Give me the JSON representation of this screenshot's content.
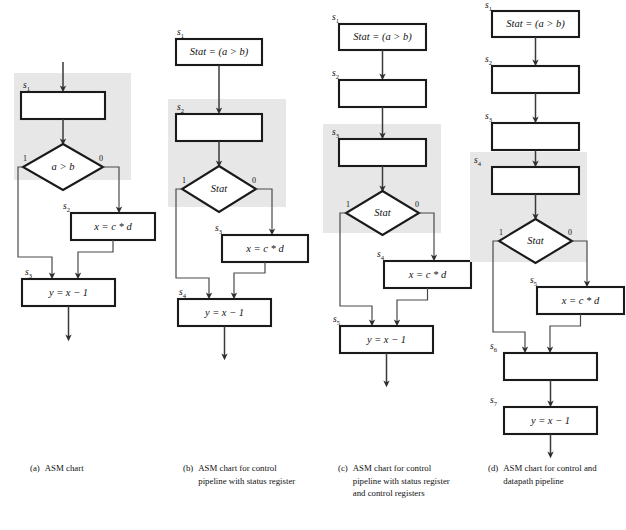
{
  "figure": {
    "shade_color": "#e7e7e7",
    "line_color": "#1a1a1a",
    "background": "#ffffff"
  },
  "charts": [
    {
      "id": "a",
      "caption_tag": "(a)",
      "caption_text": "ASM chart",
      "states": [
        {
          "name": "s",
          "index": "1",
          "type": "box",
          "text": "",
          "shaded": true
        },
        {
          "name": "",
          "index": "",
          "type": "decision",
          "text": "a > b",
          "shaded": true,
          "branch_true": "1",
          "branch_false": "0"
        },
        {
          "name": "s",
          "index": "2",
          "type": "box",
          "text": "x = c * d",
          "shaded": false
        },
        {
          "name": "s",
          "index": "3",
          "type": "box",
          "text": "y = x − 1",
          "shaded": false
        }
      ]
    },
    {
      "id": "b",
      "caption_tag": "(b)",
      "caption_text": "ASM chart for control pipeline  with status register",
      "states": [
        {
          "name": "s",
          "index": "1",
          "type": "box",
          "text": "Stat = (a > b)",
          "shaded": false
        },
        {
          "name": "s",
          "index": "2",
          "type": "box",
          "text": "",
          "shaded": true
        },
        {
          "name": "",
          "index": "",
          "type": "decision",
          "text": "Stat",
          "shaded": true,
          "branch_true": "1",
          "branch_false": "0"
        },
        {
          "name": "s",
          "index": "3",
          "type": "box",
          "text": "x = c * d",
          "shaded": false
        },
        {
          "name": "s",
          "index": "4",
          "type": "box",
          "text": "y = x − 1",
          "shaded": false
        }
      ]
    },
    {
      "id": "c",
      "caption_tag": "(c)",
      "caption_text": "ASM chart for control pipeline with status register and control registers",
      "states": [
        {
          "name": "s",
          "index": "1",
          "type": "box",
          "text": "Stat = (a > b)",
          "shaded": false
        },
        {
          "name": "s",
          "index": "2",
          "type": "box",
          "text": "",
          "shaded": false
        },
        {
          "name": "s",
          "index": "3",
          "type": "box",
          "text": "",
          "shaded": true
        },
        {
          "name": "",
          "index": "",
          "type": "decision",
          "text": "Stat",
          "shaded": true,
          "branch_true": "1",
          "branch_false": "0"
        },
        {
          "name": "s",
          "index": "4",
          "type": "box",
          "text": "x = c * d",
          "shaded": false
        },
        {
          "name": "s",
          "index": "5",
          "type": "box",
          "text": "y = x − 1",
          "shaded": false
        }
      ]
    },
    {
      "id": "d",
      "caption_tag": "(d)",
      "caption_text": "ASM chart for control and datapath pipeline",
      "states": [
        {
          "name": "s",
          "index": "1",
          "type": "box",
          "text": "Stat = (a > b)",
          "shaded": false
        },
        {
          "name": "s",
          "index": "2",
          "type": "box",
          "text": "",
          "shaded": false
        },
        {
          "name": "s",
          "index": "3",
          "type": "box",
          "text": "",
          "shaded": false
        },
        {
          "name": "s",
          "index": "4",
          "type": "box",
          "text": "",
          "shaded": true
        },
        {
          "name": "",
          "index": "",
          "type": "decision",
          "text": "Stat",
          "shaded": true,
          "branch_true": "1",
          "branch_false": "0"
        },
        {
          "name": "s",
          "index": "5",
          "type": "box",
          "text": "x = c * d",
          "shaded": false
        },
        {
          "name": "s",
          "index": "6",
          "type": "box",
          "text": "",
          "shaded": false
        },
        {
          "name": "s",
          "index": "7",
          "type": "box",
          "text": "y = x − 1",
          "shaded": false
        }
      ]
    }
  ],
  "labels": {
    "s1": "s",
    "s2": "s",
    "s3": "s",
    "s4": "s",
    "s5": "s",
    "s6": "s",
    "s7": "s",
    "sub1": "1",
    "sub2": "2",
    "sub3": "3",
    "sub4": "4",
    "sub5": "5",
    "sub6": "6",
    "sub7": "7",
    "branch_true": "1",
    "branch_false": "0",
    "expr_stat_assign": "Stat = (a > b)",
    "expr_a_gt_b": "a > b",
    "expr_stat": "Stat",
    "expr_mul": "x = c * d",
    "expr_dec": "y = x − 1",
    "empty": ""
  },
  "captions": {
    "a": {
      "tag": "(a)",
      "text": "ASM chart"
    },
    "b": {
      "tag": "(b)",
      "text": "ASM chart for control pipeline  with status register"
    },
    "c": {
      "tag": "(c)",
      "text": "ASM chart for control pipeline with status register and control registers"
    },
    "d": {
      "tag": "(d)",
      "text": "ASM chart for control and datapath pipeline"
    }
  }
}
